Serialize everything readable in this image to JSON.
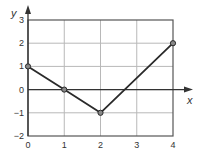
{
  "chart_data": {
    "type": "line",
    "title": "",
    "xlabel": "x",
    "ylabel": "y",
    "x": [
      0,
      1,
      2,
      4
    ],
    "series": [
      {
        "name": "piecewise-linear",
        "values": [
          1,
          0,
          -1,
          2
        ],
        "markers": true
      }
    ],
    "xlim": [
      0,
      4
    ],
    "ylim": [
      -2,
      3
    ],
    "xticks": [
      "0",
      "1",
      "2",
      "3",
      "4"
    ],
    "yticks": [
      "3",
      "2",
      "1",
      "0",
      "−1",
      "−2"
    ],
    "grid": true,
    "legend": null
  },
  "colors": {
    "line": "#2a2a2a",
    "grid": "#b8b8b8",
    "frame": "#555555",
    "axis": "#333333",
    "marker_fill": "#888888"
  }
}
